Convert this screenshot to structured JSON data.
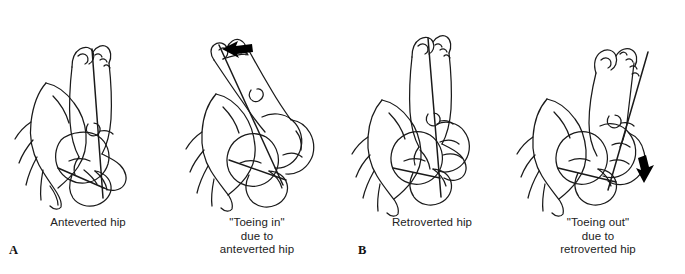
{
  "figure": {
    "type": "medical-line-drawing",
    "background_color": "#ffffff",
    "line_color": "#1a1a1a",
    "arrow_color": "#000000",
    "panels": [
      {
        "id": "anteverted-hip",
        "label": "A",
        "caption": "Anteverted hip",
        "arrow": null,
        "axis_note": "femoral neck axis tilted"
      },
      {
        "id": "toeing-in",
        "label": "",
        "caption": "\"Toeing in\"\ndue to\nanteverted hip",
        "arrow": "arrow-left",
        "axis_note": "limb internally rotated"
      },
      {
        "id": "retroverted-hip",
        "label": "B",
        "caption": "Retroverted hip",
        "arrow": null,
        "axis_note": "femoral neck axis near vertical"
      },
      {
        "id": "toeing-out",
        "label": "",
        "caption": "\"Toeing out\"\ndue to\nretroverted hip",
        "arrow": "arrow-down",
        "axis_note": "limb externally rotated"
      }
    ]
  },
  "captions": {
    "anteverted_hip": "Anteverted hip",
    "toeing_in": "\"Toeing in\"\ndue to\nanteverted hip",
    "retroverted_hip": "Retroverted hip",
    "toeing_out": "\"Toeing out\"\ndue to\nretroverted hip"
  },
  "panel_labels": {
    "a": "A",
    "b": "B"
  }
}
